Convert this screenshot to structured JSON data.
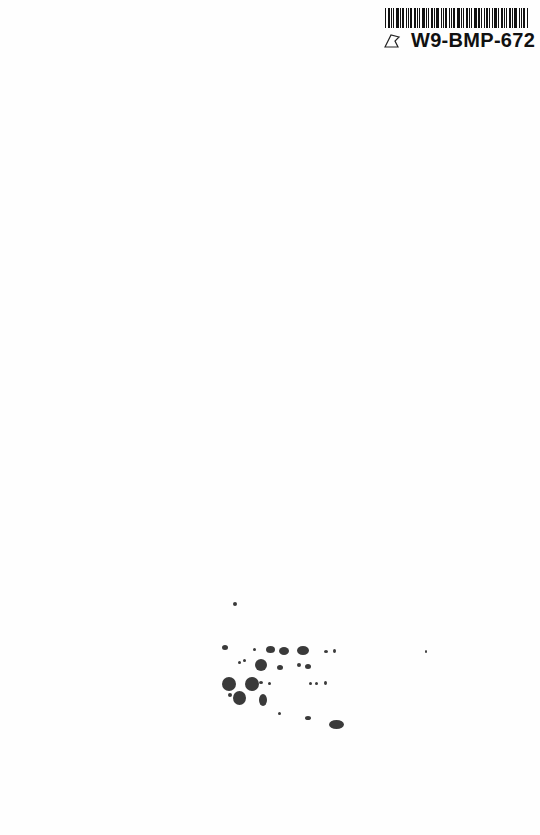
{
  "label": {
    "code": "W9-BMP-672",
    "icon": "leaf-outline-icon"
  },
  "specks": [
    {
      "x": 233,
      "y": 602,
      "w": 4,
      "h": 4
    },
    {
      "x": 222,
      "y": 645,
      "w": 6,
      "h": 5
    },
    {
      "x": 253,
      "y": 648,
      "w": 3,
      "h": 3
    },
    {
      "x": 266,
      "y": 646,
      "w": 9,
      "h": 7
    },
    {
      "x": 279,
      "y": 647,
      "w": 10,
      "h": 8
    },
    {
      "x": 297,
      "y": 646,
      "w": 12,
      "h": 9
    },
    {
      "x": 324,
      "y": 650,
      "w": 4,
      "h": 3
    },
    {
      "x": 333,
      "y": 649,
      "w": 3,
      "h": 4
    },
    {
      "x": 238,
      "y": 661,
      "w": 3,
      "h": 3
    },
    {
      "x": 243,
      "y": 659,
      "w": 3,
      "h": 3
    },
    {
      "x": 255,
      "y": 659,
      "w": 12,
      "h": 12
    },
    {
      "x": 277,
      "y": 665,
      "w": 6,
      "h": 5
    },
    {
      "x": 297,
      "y": 663,
      "w": 4,
      "h": 4
    },
    {
      "x": 305,
      "y": 664,
      "w": 6,
      "h": 5
    },
    {
      "x": 222,
      "y": 677,
      "w": 14,
      "h": 14
    },
    {
      "x": 245,
      "y": 677,
      "w": 14,
      "h": 14
    },
    {
      "x": 259,
      "y": 681,
      "w": 4,
      "h": 3
    },
    {
      "x": 268,
      "y": 682,
      "w": 3,
      "h": 3
    },
    {
      "x": 309,
      "y": 682,
      "w": 3,
      "h": 3
    },
    {
      "x": 315,
      "y": 682,
      "w": 3,
      "h": 3
    },
    {
      "x": 324,
      "y": 681,
      "w": 3,
      "h": 4
    },
    {
      "x": 228,
      "y": 693,
      "w": 4,
      "h": 4
    },
    {
      "x": 233,
      "y": 691,
      "w": 13,
      "h": 14
    },
    {
      "x": 259,
      "y": 694,
      "w": 8,
      "h": 12
    },
    {
      "x": 278,
      "y": 712,
      "w": 3,
      "h": 3
    },
    {
      "x": 305,
      "y": 716,
      "w": 6,
      "h": 4
    },
    {
      "x": 329,
      "y": 720,
      "w": 15,
      "h": 9
    },
    {
      "x": 425,
      "y": 650,
      "w": 2,
      "h": 3
    }
  ]
}
